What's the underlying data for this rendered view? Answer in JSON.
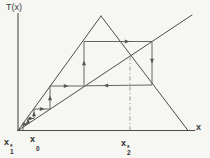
{
  "figure": {
    "background": "#f6f6f3",
    "ink": "#4d4d4d",
    "cobweb_ink": "#555555",
    "guide_ink": "#8c8c8c",
    "label_ink": "#2e2e2e"
  },
  "labels": {
    "y_axis_title": "T(x)",
    "x_axis_title": "x",
    "x1_fixed": {
      "base": "x",
      "sup": "*",
      "sub": "1"
    },
    "x0_start": {
      "base": "x",
      "sup": "",
      "sub": "0"
    },
    "x2_fixed": {
      "base": "x",
      "sup": "*",
      "sub": "2"
    }
  },
  "diagram": {
    "width": 210,
    "height": 158,
    "lines": [
      {
        "name": "y-axis",
        "x1": 18,
        "y1": 13.5,
        "x2": 18,
        "y2": 130.5,
        "w": 1.1
      },
      {
        "name": "x-axis",
        "x1": 17.5,
        "y1": 130.5,
        "x2": 195,
        "y2": 130.5,
        "w": 1.1
      },
      {
        "name": "identity-line",
        "x1": 18,
        "y1": 130.5,
        "x2": 192,
        "y2": 15,
        "w": 1
      },
      {
        "name": "tent-map-left-branch",
        "x1": 18,
        "y1": 130.5,
        "x2": 101,
        "y2": 16,
        "w": 1
      },
      {
        "name": "tent-map-right-branch",
        "x1": 101,
        "y1": 16,
        "x2": 188,
        "y2": 130.5,
        "w": 1
      }
    ],
    "guide": {
      "name": "fixed-point-guide-x2",
      "x1": 130,
      "y1": 56.5,
      "x2": 130,
      "y2": 130,
      "dash": "4 2.5 1 2.5",
      "w": 0.9
    },
    "cobweb": {
      "name": "cobweb-trajectory",
      "points": "23,130 23,124 28,124 28,118.5 34,118.5 34,109 50,109 50,86 84,86 84,41.5 152,41.5 152,85 85,85.8",
      "w": 0.9
    },
    "arrows": [
      {
        "x": 25,
        "y": 124,
        "dir": "right"
      },
      {
        "x": 28,
        "y": 121,
        "dir": "up"
      },
      {
        "x": 31,
        "y": 118.5,
        "dir": "right"
      },
      {
        "x": 34,
        "y": 114,
        "dir": "up"
      },
      {
        "x": 42,
        "y": 109,
        "dir": "right"
      },
      {
        "x": 50,
        "y": 98,
        "dir": "up"
      },
      {
        "x": 66,
        "y": 86,
        "dir": "right"
      },
      {
        "x": 84,
        "y": 63,
        "dir": "up"
      },
      {
        "x": 127,
        "y": 41.5,
        "dir": "right"
      },
      {
        "x": 152,
        "y": 61,
        "dir": "down"
      },
      {
        "x": 106,
        "y": 85.4,
        "dir": "left"
      }
    ]
  }
}
